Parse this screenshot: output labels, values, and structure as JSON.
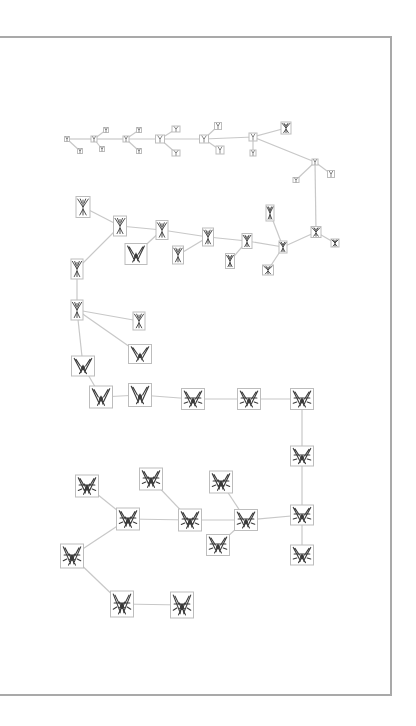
{
  "diagram": {
    "type": "biomorph-lineage-tree",
    "frame": {
      "border_color": "#a9a9a9",
      "background": "#ffffff"
    },
    "edge_color": "#c8c8c8",
    "node_border_color": "#bdbdbd",
    "glyph_color": "#3a3a3a",
    "nodes": [
      {
        "id": "n0",
        "x": 67,
        "y": 139,
        "w": 5,
        "h": 5,
        "level": 0
      },
      {
        "id": "n1",
        "x": 80,
        "y": 151,
        "w": 5,
        "h": 5,
        "level": 0
      },
      {
        "id": "n2",
        "x": 94,
        "y": 139,
        "w": 6,
        "h": 6,
        "level": 0
      },
      {
        "id": "n3",
        "x": 106,
        "y": 130,
        "w": 5,
        "h": 5,
        "level": 0
      },
      {
        "id": "n4",
        "x": 102,
        "y": 149,
        "w": 5,
        "h": 5,
        "level": 0
      },
      {
        "id": "n5",
        "x": 126,
        "y": 139,
        "w": 6,
        "h": 6,
        "level": 0
      },
      {
        "id": "n6",
        "x": 139,
        "y": 130,
        "w": 5,
        "h": 5,
        "level": 0
      },
      {
        "id": "n7",
        "x": 139,
        "y": 151,
        "w": 5,
        "h": 5,
        "level": 0
      },
      {
        "id": "n8",
        "x": 160,
        "y": 139,
        "w": 9,
        "h": 8,
        "level": 1
      },
      {
        "id": "n9",
        "x": 176,
        "y": 129,
        "w": 8,
        "h": 6,
        "level": 1
      },
      {
        "id": "n10",
        "x": 176,
        "y": 153,
        "w": 8,
        "h": 6,
        "level": 1
      },
      {
        "id": "n11",
        "x": 204,
        "y": 139,
        "w": 9,
        "h": 8,
        "level": 1
      },
      {
        "id": "n12",
        "x": 218,
        "y": 126,
        "w": 7,
        "h": 7,
        "level": 1
      },
      {
        "id": "n13",
        "x": 220,
        "y": 150,
        "w": 8,
        "h": 8,
        "level": 1
      },
      {
        "id": "n14",
        "x": 253,
        "y": 137,
        "w": 8,
        "h": 8,
        "level": 1
      },
      {
        "id": "n15",
        "x": 253,
        "y": 153,
        "w": 6,
        "h": 6,
        "level": 1
      },
      {
        "id": "n16",
        "x": 286,
        "y": 128,
        "w": 10,
        "h": 12,
        "level": 2
      },
      {
        "id": "n17",
        "x": 315,
        "y": 162,
        "w": 6,
        "h": 6,
        "level": 1
      },
      {
        "id": "n18",
        "x": 296,
        "y": 180,
        "w": 6,
        "h": 5,
        "level": 1
      },
      {
        "id": "n19",
        "x": 331,
        "y": 174,
        "w": 7,
        "h": 7,
        "level": 1
      },
      {
        "id": "n20",
        "x": 316,
        "y": 232,
        "w": 10,
        "h": 11,
        "level": 2
      },
      {
        "id": "n21",
        "x": 335,
        "y": 243,
        "w": 8,
        "h": 8,
        "level": 2
      },
      {
        "id": "n22",
        "x": 283,
        "y": 247,
        "w": 8,
        "h": 12,
        "level": 2
      },
      {
        "id": "n23",
        "x": 270,
        "y": 213,
        "w": 8,
        "h": 16,
        "level": 2
      },
      {
        "id": "n24",
        "x": 268,
        "y": 270,
        "w": 11,
        "h": 10,
        "level": 2
      },
      {
        "id": "n25",
        "x": 247,
        "y": 241,
        "w": 10,
        "h": 15,
        "level": 2
      },
      {
        "id": "n26",
        "x": 230,
        "y": 261,
        "w": 9,
        "h": 15,
        "level": 2
      },
      {
        "id": "n27",
        "x": 208,
        "y": 237,
        "w": 11,
        "h": 18,
        "level": 3
      },
      {
        "id": "n28",
        "x": 178,
        "y": 255,
        "w": 11,
        "h": 18,
        "level": 3
      },
      {
        "id": "n29",
        "x": 162,
        "y": 230,
        "w": 12,
        "h": 19,
        "level": 3
      },
      {
        "id": "n30",
        "x": 136,
        "y": 254,
        "w": 22,
        "h": 21,
        "level": 4
      },
      {
        "id": "n31",
        "x": 120,
        "y": 226,
        "w": 13,
        "h": 20,
        "level": 3
      },
      {
        "id": "n32",
        "x": 83,
        "y": 207,
        "w": 14,
        "h": 21,
        "level": 3
      },
      {
        "id": "n33",
        "x": 77,
        "y": 269,
        "w": 12,
        "h": 20,
        "level": 3
      },
      {
        "id": "n34",
        "x": 77,
        "y": 310,
        "w": 12,
        "h": 20,
        "level": 3
      },
      {
        "id": "n35",
        "x": 139,
        "y": 321,
        "w": 12,
        "h": 18,
        "level": 3
      },
      {
        "id": "n36",
        "x": 140,
        "y": 354,
        "w": 23,
        "h": 19,
        "level": 4
      },
      {
        "id": "n37",
        "x": 83,
        "y": 366,
        "w": 23,
        "h": 20,
        "level": 4
      },
      {
        "id": "n38",
        "x": 101,
        "y": 397,
        "w": 23,
        "h": 22,
        "level": 4
      },
      {
        "id": "n39",
        "x": 140,
        "y": 395,
        "w": 23,
        "h": 23,
        "level": 4
      },
      {
        "id": "n40",
        "x": 193,
        "y": 399,
        "w": 23,
        "h": 21,
        "level": 5
      },
      {
        "id": "n41",
        "x": 249,
        "y": 399,
        "w": 23,
        "h": 21,
        "level": 5
      },
      {
        "id": "n42",
        "x": 302,
        "y": 399,
        "w": 23,
        "h": 21,
        "level": 5
      },
      {
        "id": "n43",
        "x": 302,
        "y": 456,
        "w": 23,
        "h": 20,
        "level": 5
      },
      {
        "id": "n44",
        "x": 302,
        "y": 515,
        "w": 23,
        "h": 20,
        "level": 5
      },
      {
        "id": "n45",
        "x": 302,
        "y": 555,
        "w": 23,
        "h": 20,
        "level": 5
      },
      {
        "id": "n46",
        "x": 246,
        "y": 520,
        "w": 23,
        "h": 21,
        "level": 5
      },
      {
        "id": "n47",
        "x": 221,
        "y": 482,
        "w": 23,
        "h": 22,
        "level": 6
      },
      {
        "id": "n48",
        "x": 218,
        "y": 545,
        "w": 23,
        "h": 21,
        "level": 5
      },
      {
        "id": "n49",
        "x": 190,
        "y": 520,
        "w": 23,
        "h": 22,
        "level": 6
      },
      {
        "id": "n50",
        "x": 151,
        "y": 479,
        "w": 23,
        "h": 22,
        "level": 6
      },
      {
        "id": "n51",
        "x": 128,
        "y": 519,
        "w": 23,
        "h": 22,
        "level": 6
      },
      {
        "id": "n52",
        "x": 87,
        "y": 486,
        "w": 23,
        "h": 22,
        "level": 6
      },
      {
        "id": "n53",
        "x": 72,
        "y": 556,
        "w": 23,
        "h": 24,
        "level": 6
      },
      {
        "id": "n54",
        "x": 122,
        "y": 604,
        "w": 23,
        "h": 26,
        "level": 6
      },
      {
        "id": "n55",
        "x": 182,
        "y": 605,
        "w": 23,
        "h": 26,
        "level": 6
      }
    ],
    "edges": [
      [
        "n0",
        "n1"
      ],
      [
        "n0",
        "n2"
      ],
      [
        "n2",
        "n3"
      ],
      [
        "n2",
        "n4"
      ],
      [
        "n2",
        "n5"
      ],
      [
        "n5",
        "n6"
      ],
      [
        "n5",
        "n7"
      ],
      [
        "n5",
        "n8"
      ],
      [
        "n8",
        "n9"
      ],
      [
        "n8",
        "n10"
      ],
      [
        "n8",
        "n11"
      ],
      [
        "n11",
        "n12"
      ],
      [
        "n11",
        "n13"
      ],
      [
        "n11",
        "n14"
      ],
      [
        "n14",
        "n15"
      ],
      [
        "n14",
        "n16"
      ],
      [
        "n14",
        "n17"
      ],
      [
        "n17",
        "n18"
      ],
      [
        "n17",
        "n19"
      ],
      [
        "n17",
        "n20"
      ],
      [
        "n20",
        "n21"
      ],
      [
        "n20",
        "n22"
      ],
      [
        "n22",
        "n23"
      ],
      [
        "n22",
        "n24"
      ],
      [
        "n22",
        "n25"
      ],
      [
        "n25",
        "n26"
      ],
      [
        "n25",
        "n27"
      ],
      [
        "n27",
        "n28"
      ],
      [
        "n27",
        "n29"
      ],
      [
        "n29",
        "n30"
      ],
      [
        "n29",
        "n31"
      ],
      [
        "n31",
        "n32"
      ],
      [
        "n31",
        "n33"
      ],
      [
        "n33",
        "n34"
      ],
      [
        "n34",
        "n35"
      ],
      [
        "n34",
        "n36"
      ],
      [
        "n34",
        "n37"
      ],
      [
        "n37",
        "n38"
      ],
      [
        "n38",
        "n39"
      ],
      [
        "n39",
        "n40"
      ],
      [
        "n40",
        "n41"
      ],
      [
        "n41",
        "n42"
      ],
      [
        "n42",
        "n43"
      ],
      [
        "n43",
        "n44"
      ],
      [
        "n44",
        "n45"
      ],
      [
        "n44",
        "n46"
      ],
      [
        "n46",
        "n47"
      ],
      [
        "n46",
        "n48"
      ],
      [
        "n46",
        "n49"
      ],
      [
        "n49",
        "n50"
      ],
      [
        "n49",
        "n51"
      ],
      [
        "n51",
        "n52"
      ],
      [
        "n51",
        "n53"
      ],
      [
        "n53",
        "n54"
      ],
      [
        "n54",
        "n55"
      ]
    ]
  }
}
